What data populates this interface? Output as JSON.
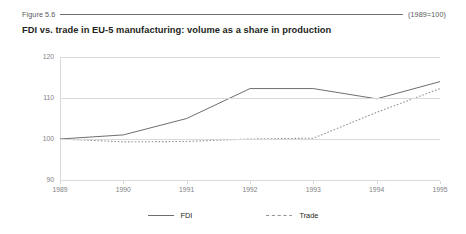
{
  "header": {
    "figure_number": "Figure 5.6",
    "base_note": "(1989=100)"
  },
  "title": "FDI vs. trade in EU-5 manufacturing: volume as a share in production",
  "legend": {
    "items": [
      {
        "label": "FDI",
        "style": "solid",
        "color": "#6d6e71"
      },
      {
        "label": "Trade",
        "style": "dashed",
        "color": "#939598"
      }
    ]
  },
  "chart_data": {
    "type": "line",
    "title": "FDI vs. trade in EU-5 manufacturing: volume as a share in production",
    "subtitle": "(1989=100)",
    "xlabel": "",
    "ylabel": "",
    "categories": [
      "1989",
      "1990",
      "1991",
      "1992",
      "1993",
      "1994",
      "1995"
    ],
    "x": [
      1989,
      1990,
      1991,
      1992,
      1993,
      1994,
      1995
    ],
    "ylim": [
      90,
      120
    ],
    "yticks": [
      90,
      100,
      110,
      120
    ],
    "ytick_labels": [
      "90",
      "100",
      "110",
      "120"
    ],
    "grid": true,
    "legend_position": "bottom",
    "series": [
      {
        "name": "FDI",
        "style": "solid",
        "color": "#6d6e71",
        "values": [
          100,
          101,
          105,
          112.3,
          112.3,
          109.8,
          114
        ]
      },
      {
        "name": "Trade",
        "style": "dashed",
        "color": "#939598",
        "values": [
          100,
          99.3,
          99.4,
          100,
          100.2,
          106.5,
          112.3
        ]
      }
    ]
  }
}
